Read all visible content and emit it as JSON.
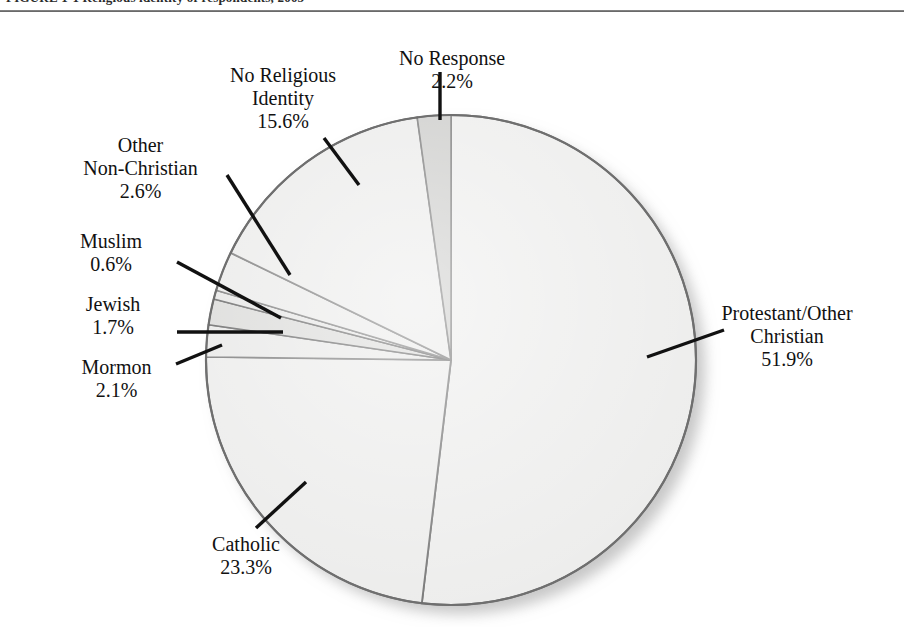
{
  "figure": {
    "caption": "FIGURE 1-1  Religious identity of respondents, 2005",
    "rule_color": "#5e5e5e"
  },
  "chart_data": {
    "type": "pie",
    "title": "",
    "start_angle_deg": 0,
    "direction": "clockwise",
    "center": {
      "x": 451,
      "y": 348
    },
    "radius": 245,
    "legend": "none",
    "labels_with_leaders": true,
    "categories": [
      "Protestant/Other Christian",
      "Catholic",
      "Mormon",
      "Jewish",
      "Muslim",
      "Other Non-Christian",
      "No Religious Identity",
      "No Response"
    ],
    "values": [
      51.9,
      23.3,
      2.1,
      1.7,
      0.6,
      2.6,
      15.6,
      2.2
    ],
    "value_suffix": "%",
    "slices": [
      {
        "name": "Protestant/Other Christian",
        "value": 51.9,
        "display": "51.9%",
        "fill": "#ececeb",
        "stroke": "#6f6f6f"
      },
      {
        "name": "Catholic",
        "value": 23.3,
        "display": "23.3%",
        "fill": "#ebebea",
        "stroke": "#6f6f6f"
      },
      {
        "name": "Mormon",
        "value": 2.1,
        "display": "2.1%",
        "fill": "#e7e7e6",
        "stroke": "#6f6f6f"
      },
      {
        "name": "Jewish",
        "value": 1.7,
        "display": "1.7%",
        "fill": "#d8d8d6",
        "stroke": "#5a5a5a"
      },
      {
        "name": "Muslim",
        "value": 0.6,
        "display": "0.6%",
        "fill": "#e4e4e3",
        "stroke": "#5a5a5a"
      },
      {
        "name": "Other Non-Christian",
        "value": 2.6,
        "display": "2.6%",
        "fill": "#e9e9e8",
        "stroke": "#6f6f6f"
      },
      {
        "name": "No Religious Identity",
        "value": 15.6,
        "display": "15.6%",
        "fill": "#eaeae9",
        "stroke": "#6f6f6f"
      },
      {
        "name": "No Response",
        "value": 2.2,
        "display": "2.2%",
        "fill": "#c9c9c7",
        "stroke": "#6f6f6f"
      }
    ]
  },
  "labels": {
    "no_response": {
      "l1": "No Response",
      "l2": "",
      "pct": "2.2%"
    },
    "no_religious": {
      "l1": "No Religious",
      "l2": "Identity",
      "pct": "15.6%"
    },
    "other_non_christian": {
      "l1": "Other",
      "l2": "Non-Christian",
      "pct": "2.6%"
    },
    "muslim": {
      "l1": "Muslim",
      "l2": "",
      "pct": "0.6%"
    },
    "jewish": {
      "l1": "Jewish",
      "l2": "",
      "pct": "1.7%"
    },
    "mormon": {
      "l1": "Mormon",
      "l2": "",
      "pct": "2.1%"
    },
    "protestant": {
      "l1": "Protestant/Other",
      "l2": "Christian",
      "pct": "51.9%"
    },
    "catholic": {
      "l1": "Catholic",
      "l2": "",
      "pct": "23.3%"
    }
  },
  "colors": {
    "slice_default_fill": "#eaeae9",
    "slice_highlight_fill": "#c9c9c7",
    "slice_stroke": "#6f6f6f",
    "leader_line": "#111111",
    "background": "#ffffff"
  }
}
